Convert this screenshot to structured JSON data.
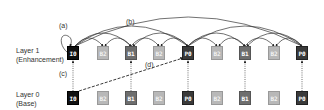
{
  "diagram": {
    "layers": [
      {
        "name": "Layer 1",
        "sub": "(Enhancement)",
        "frames": [
          "I0",
          "B2",
          "B1",
          "B2",
          "P0",
          "B2",
          "B1",
          "B2",
          "P0"
        ]
      },
      {
        "name": "Layer 0",
        "sub": "(Base)",
        "frames": [
          "I0",
          "B2",
          "B1",
          "B2",
          "P0",
          "B2",
          "B1",
          "B2",
          "P0"
        ]
      }
    ],
    "annotations": {
      "a": "(a)",
      "b": "(b)",
      "c": "(c)",
      "d": "(d)"
    },
    "colors": {
      "I": "#111111",
      "P": "#3a3a3a",
      "B1": "#6e6e6e",
      "B2": "#b8b8b8"
    }
  }
}
